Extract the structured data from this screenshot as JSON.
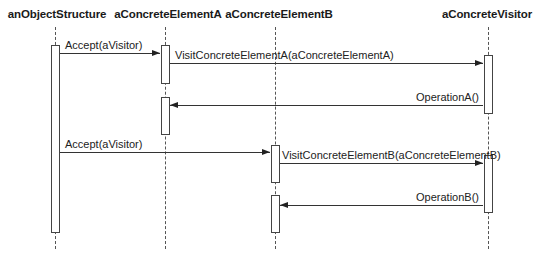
{
  "diagram": {
    "type": "UML sequence diagram",
    "objects": [
      {
        "id": "objstruct",
        "label": "anObjectStructure"
      },
      {
        "id": "elemA",
        "label": "aConcreteElementA"
      },
      {
        "id": "elemB",
        "label": "aConcreteElementB"
      },
      {
        "id": "visitor",
        "label": "aConcreteVisitor"
      }
    ],
    "messages": [
      {
        "from": "anObjectStructure",
        "to": "aConcreteElementA",
        "label": "Accept(aVisitor)",
        "direction": "right"
      },
      {
        "from": "aConcreteElementA",
        "to": "aConcreteVisitor",
        "label": "VisitConcreteElementA(aConcreteElementA)",
        "direction": "right"
      },
      {
        "from": "aConcreteVisitor",
        "to": "aConcreteElementA",
        "label": "OperationA()",
        "direction": "left"
      },
      {
        "from": "anObjectStructure",
        "to": "aConcreteElementB",
        "label": "Accept(aVisitor)",
        "direction": "right"
      },
      {
        "from": "aConcreteElementB",
        "to": "aConcreteVisitor",
        "label": "VisitConcreteElementB(aConcreteElementB)",
        "direction": "right"
      },
      {
        "from": "aConcreteVisitor",
        "to": "aConcreteElementB",
        "label": "OperationB()",
        "direction": "left"
      }
    ]
  },
  "colors": {
    "background": "#ffffff",
    "line": "#333333",
    "text": "#1a1a1a"
  }
}
